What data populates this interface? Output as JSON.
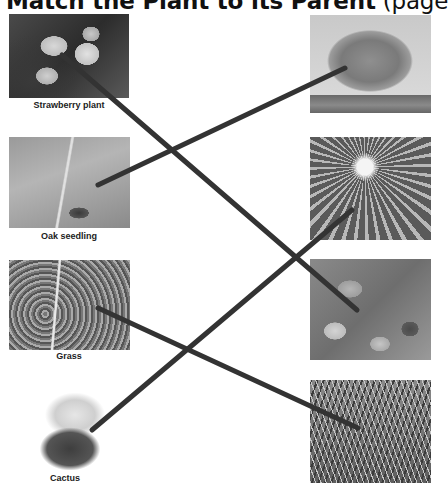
{
  "title": {
    "main": "Match the Plant to its Parent",
    "suffix": " (page"
  },
  "left_column": [
    {
      "label": "Strawberry plant",
      "image": "strawberry-plant-photo"
    },
    {
      "label": "Oak seedling",
      "image": "oak-seedling-photo"
    },
    {
      "label": "Grass",
      "image": "grass-sprout-photo"
    },
    {
      "label": "Cactus",
      "image": "cactus-photo"
    }
  ],
  "right_column": [
    {
      "label": "",
      "image": "oak-tree-photo"
    },
    {
      "label": "",
      "image": "barrel-cactus-photo"
    },
    {
      "label": "",
      "image": "strawberry-leaves-photo"
    },
    {
      "label": "",
      "image": "grass-lawn-photo"
    }
  ],
  "matches": [
    {
      "from": "Strawberry plant",
      "to": "strawberry-leaves-photo",
      "x1": 62,
      "y1": 55,
      "x2": 357,
      "y2": 310
    },
    {
      "from": "Oak seedling",
      "to": "oak-tree-photo",
      "x1": 98,
      "y1": 185,
      "x2": 345,
      "y2": 68
    },
    {
      "from": "Grass",
      "to": "grass-lawn-photo",
      "x1": 98,
      "y1": 308,
      "x2": 358,
      "y2": 428
    },
    {
      "from": "Cactus",
      "to": "barrel-cactus-photo",
      "x1": 92,
      "y1": 430,
      "x2": 352,
      "y2": 210
    }
  ],
  "colors": {
    "line": "#333333",
    "background": "#ffffff",
    "text": "#222222"
  }
}
